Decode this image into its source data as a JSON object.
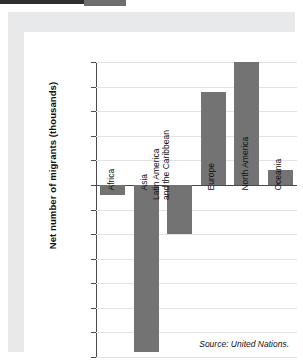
{
  "chart_data": {
    "type": "bar",
    "title": "",
    "xlabel": "",
    "ylabel": "Net number of migrants (thousands)",
    "categories": [
      "Africa",
      "Asia",
      "Latin America\nand the Caribbean",
      "Europe",
      "North America",
      "Oceania"
    ],
    "values": [
      -80,
      -1360,
      -400,
      760,
      1000,
      120
    ],
    "ylim": [
      -1400,
      1000
    ],
    "ytick_labels": [
      "1,000",
      "800",
      "600",
      "400",
      "200",
      "0",
      "–200",
      "–400",
      "–600",
      "–800",
      "–1,000",
      "–1,200",
      "–1,400"
    ],
    "ytick_values": [
      1000,
      800,
      600,
      400,
      200,
      0,
      -200,
      -400,
      -600,
      -800,
      -1000,
      -1200,
      -1400
    ],
    "grid": true,
    "legend": "none",
    "bar_color": "#737373",
    "annotation": "Source: United Nations."
  },
  "source_note": "Source: United Nations."
}
